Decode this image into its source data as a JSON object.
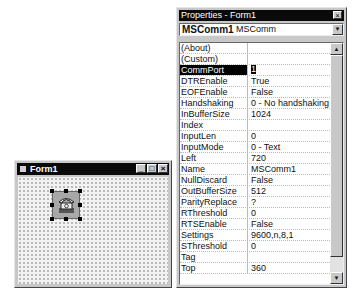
{
  "form_window": {
    "title": "Form1",
    "buttons": {
      "minimize": "_",
      "maximize": "□",
      "close": "×"
    },
    "control": {
      "name": "MSComm1",
      "icon": "telephone-icon",
      "selected": true
    }
  },
  "properties_window": {
    "title": "Properties - Form1",
    "close": "×",
    "object_selector": {
      "object": "MSComm1",
      "type": "MSComm",
      "arrow": "▼"
    },
    "scroll": {
      "up": "▲",
      "down": "▼"
    },
    "rows": [
      {
        "name": "(About)",
        "value": ""
      },
      {
        "name": "(Custom)",
        "value": ""
      },
      {
        "name": "CommPort",
        "value": "1",
        "selected": true
      },
      {
        "name": "DTREnable",
        "value": "True"
      },
      {
        "name": "EOFEnable",
        "value": "False"
      },
      {
        "name": "Handshaking",
        "value": "0 - No handshaking"
      },
      {
        "name": "InBufferSize",
        "value": "1024"
      },
      {
        "name": "Index",
        "value": ""
      },
      {
        "name": "InputLen",
        "value": "0"
      },
      {
        "name": "InputMode",
        "value": "0 - Text"
      },
      {
        "name": "Left",
        "value": "720"
      },
      {
        "name": "Name",
        "value": "MSComm1"
      },
      {
        "name": "NullDiscard",
        "value": "False"
      },
      {
        "name": "OutBufferSize",
        "value": "512"
      },
      {
        "name": "ParityReplace",
        "value": "?"
      },
      {
        "name": "RThreshold",
        "value": "0"
      },
      {
        "name": "RTSEnable",
        "value": "False"
      },
      {
        "name": "Settings",
        "value": "9600,n,8,1"
      },
      {
        "name": "SThreshold",
        "value": "0"
      },
      {
        "name": "Tag",
        "value": ""
      },
      {
        "name": "Top",
        "value": "360"
      }
    ]
  }
}
